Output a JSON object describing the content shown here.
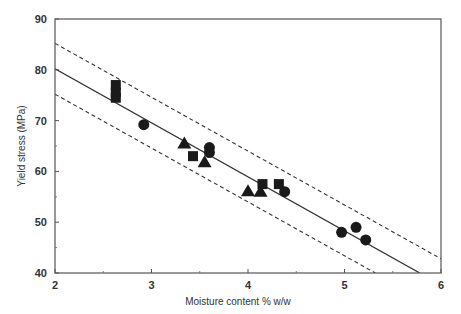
{
  "chart_data": {
    "type": "scatter",
    "title": "",
    "xlabel": "Moisture content % w/w",
    "ylabel": "Yield stress (MPa)",
    "xlim": [
      2,
      6
    ],
    "ylim": [
      40,
      90
    ],
    "x_ticks": [
      2,
      3,
      4,
      5,
      6
    ],
    "y_ticks": [
      40,
      50,
      60,
      70,
      80,
      90
    ],
    "grid": false,
    "legend": null,
    "series": [
      {
        "name": "squares",
        "marker": "square",
        "points": [
          [
            2.63,
            77
          ],
          [
            2.63,
            75.5
          ],
          [
            2.63,
            74.5
          ],
          [
            3.43,
            63
          ],
          [
            4.15,
            57.5
          ],
          [
            4.32,
            57.5
          ]
        ]
      },
      {
        "name": "circles",
        "marker": "circle",
        "points": [
          [
            2.92,
            69.2
          ],
          [
            3.6,
            64.7
          ],
          [
            3.6,
            63.7
          ],
          [
            4.38,
            56
          ],
          [
            4.97,
            48
          ],
          [
            5.12,
            49
          ],
          [
            5.22,
            46.5
          ]
        ]
      },
      {
        "name": "triangles",
        "marker": "triangle",
        "points": [
          [
            3.34,
            65.5
          ],
          [
            3.55,
            61.8
          ],
          [
            4.0,
            56.1
          ],
          [
            4.13,
            56
          ]
        ]
      }
    ],
    "lines": [
      {
        "name": "regression",
        "style": "solid",
        "from": [
          2,
          80.2
        ],
        "to": [
          5.78,
          40
        ]
      },
      {
        "name": "upper-bound",
        "style": "dashed",
        "from": [
          2,
          85.2
        ],
        "to": [
          6,
          42.8
        ]
      },
      {
        "name": "lower-bound",
        "style": "dashed",
        "from": [
          2,
          75.2
        ],
        "to": [
          5.32,
          40
        ]
      }
    ]
  },
  "colors": {
    "axis": "#555555",
    "marker": "#1a1a1a",
    "line": "#333333"
  }
}
